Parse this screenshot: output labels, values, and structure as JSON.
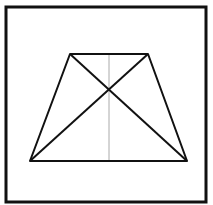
{
  "diagram": {
    "type": "isosceles-trapezoid-with-diagonals",
    "frame": {
      "x": 6,
      "y": 7,
      "width": 200,
      "height": 195,
      "stroke": "#111111",
      "stroke_width": 3
    },
    "trapezoid": {
      "vertices": {
        "top_left": [
          70,
          54
        ],
        "top_right": [
          148,
          54
        ],
        "bottom_right": [
          187,
          161
        ],
        "bottom_left": [
          30,
          161
        ]
      },
      "stroke": "#111111",
      "stroke_width": 2
    },
    "diagonals": [
      {
        "from": "top_left",
        "to": "bottom_right"
      },
      {
        "from": "top_right",
        "to": "bottom_left"
      }
    ],
    "axis_of_symmetry": {
      "x": 109,
      "y1": 54,
      "y2": 161,
      "stroke": "#aaaaaa",
      "stroke_width": 1
    },
    "intersection": [
      109,
      84
    ]
  }
}
